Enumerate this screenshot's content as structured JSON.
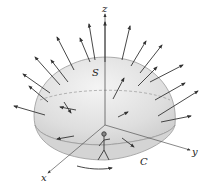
{
  "diagram": {
    "type": "stokes-theorem-surface",
    "labels": {
      "z_axis": "z",
      "y_axis": "y",
      "x_axis": "x",
      "surface": "S",
      "curve": "C"
    },
    "elements": [
      "dome-shaped surface S with outward normal vectors",
      "boundary curve C on the xy-plane",
      "walking person figure on boundary",
      "orientation arrow along C (counterclockwise)",
      "dashed equator line on surface"
    ],
    "colors": {
      "surface_fill": "#e6e6e6",
      "surface_edge": "#9a9a9a",
      "arrow": "#333333",
      "axis": "#555555"
    }
  }
}
